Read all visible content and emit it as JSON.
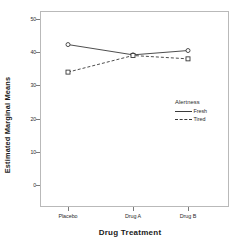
{
  "chart_data": {
    "type": "line",
    "title": "",
    "xlabel": "Drug Treatment",
    "ylabel": "Estimated Marginal Means",
    "categories": [
      "Placebo",
      "Drug A",
      "Drug B"
    ],
    "series": [
      {
        "name": "Fresh",
        "values": [
          42.3,
          39.2,
          40.5
        ],
        "linestyle": "solid",
        "marker": "circle"
      },
      {
        "name": "Tired",
        "values": [
          34.0,
          39.0,
          38.0
        ],
        "linestyle": "dashed",
        "marker": "square"
      }
    ],
    "ylim": [
      0,
      52
    ],
    "yticks": [
      0,
      10,
      20,
      30,
      40,
      50
    ],
    "ytick_labels": [
      "0",
      "10",
      "20",
      "30",
      "40",
      "50"
    ],
    "grid": false,
    "legend_position": "inside-right",
    "legend_title": "Alertness",
    "line_color": "#3a3a3a",
    "frame_color": "#b9b9b9",
    "background": "#ffffff"
  },
  "axes": {
    "y_title": "Estimated Marginal Means",
    "x_title": "Drug Treatment"
  },
  "legend": {
    "title": "Alertness",
    "entries": [
      {
        "label": "Fresh",
        "style": "solid"
      },
      {
        "label": "Tired",
        "style": "dashed"
      }
    ]
  }
}
